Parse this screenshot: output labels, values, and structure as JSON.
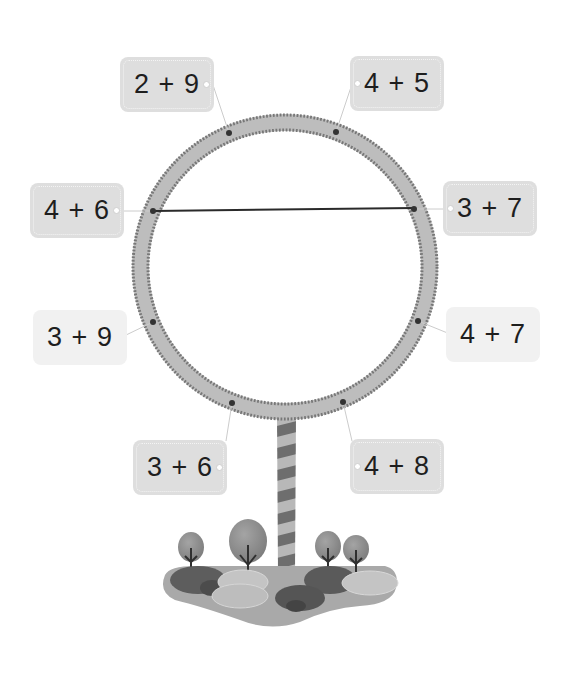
{
  "puzzle": {
    "ring": {
      "cx": 285,
      "cy": 267,
      "outer_radius": 153,
      "inner_radius": 136,
      "color": "#bdbdbd",
      "tick_color": "#777777"
    },
    "cards": [
      {
        "id": "c29",
        "expression": "2 + 9",
        "sum": 11,
        "x": 120,
        "y": 57,
        "style": "dashed",
        "port": "right",
        "dot": [
          229,
          133
        ]
      },
      {
        "id": "c45",
        "expression": "4 + 5",
        "sum": 9,
        "x": 350,
        "y": 56,
        "style": "dashed",
        "port": "left",
        "dot": [
          336,
          132
        ]
      },
      {
        "id": "c46",
        "expression": "4 + 6",
        "sum": 10,
        "x": 30,
        "y": 183,
        "style": "dashed",
        "port": "right",
        "dot": [
          153,
          211
        ]
      },
      {
        "id": "c37",
        "expression": "3 + 7",
        "sum": 10,
        "x": 443,
        "y": 181,
        "style": "dashed",
        "port": "left",
        "dot": [
          414,
          209
        ]
      },
      {
        "id": "c39",
        "expression": "3 + 9",
        "sum": 12,
        "x": 33,
        "y": 310,
        "style": "light",
        "port": "none",
        "dot": [
          153,
          322
        ]
      },
      {
        "id": "c47",
        "expression": "4 + 7",
        "sum": 11,
        "x": 446,
        "y": 307,
        "style": "light",
        "port": "none",
        "dot": [
          418,
          321
        ]
      },
      {
        "id": "c36",
        "expression": "3 + 6",
        "sum": 9,
        "x": 133,
        "y": 440,
        "style": "dashed",
        "port": "right",
        "dot": [
          232,
          403
        ]
      },
      {
        "id": "c48",
        "expression": "4 + 8",
        "sum": 12,
        "x": 350,
        "y": 439,
        "style": "dashed",
        "port": "left",
        "dot": [
          343,
          402
        ]
      }
    ],
    "connections": [
      {
        "from": "4 + 6",
        "to": "3 + 7",
        "x1": 153,
        "y1": 211,
        "x2": 414,
        "y2": 208
      }
    ],
    "pole": {
      "x": 277,
      "y": 420,
      "width": 19,
      "height": 150
    },
    "island": {
      "trees": 4
    }
  }
}
